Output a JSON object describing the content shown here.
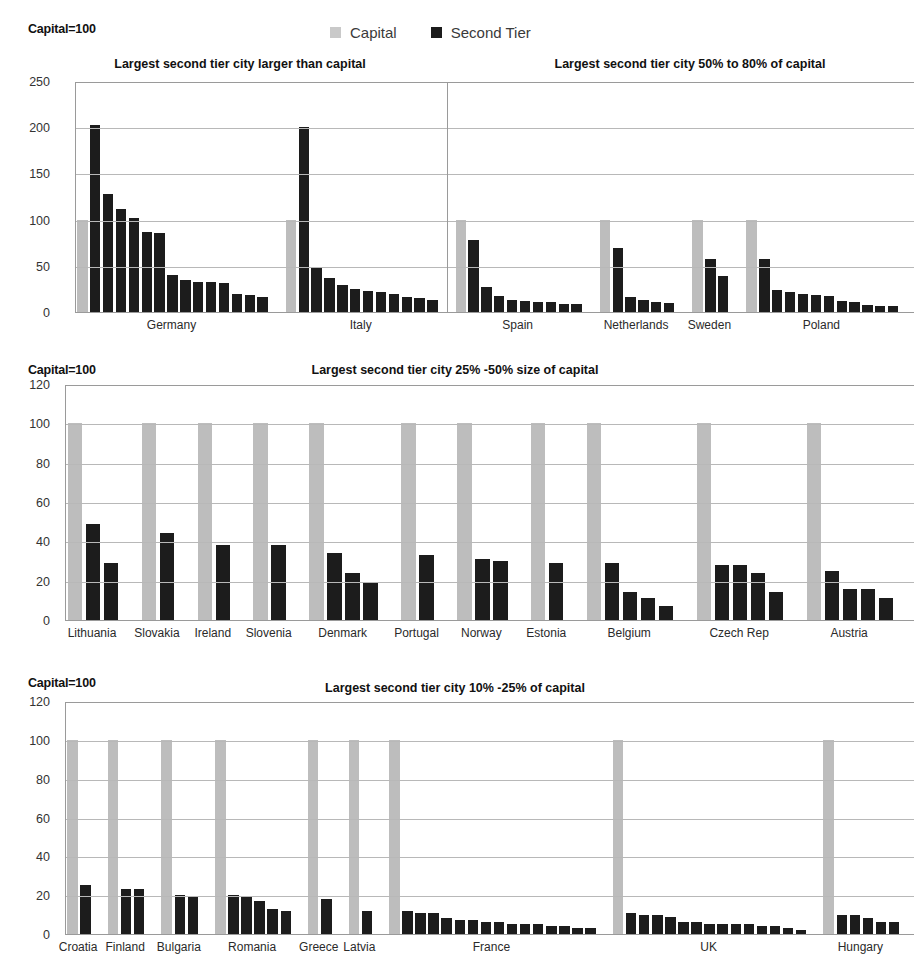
{
  "legend": {
    "items": [
      {
        "label": "Capital",
        "color": "#bdbdbd",
        "swatch_name": "capital-swatch"
      },
      {
        "label": "Second Tier",
        "color": "#1c1c1c",
        "swatch_name": "second-tier-swatch"
      }
    ]
  },
  "panels": [
    {
      "id": "panel-1",
      "capital_note": "Capital=100",
      "titles": [
        "Largest second tier city larger than capital",
        "Largest second tier city 50% to 80% of capital"
      ],
      "y_ticks": [
        0,
        50,
        100,
        150,
        200,
        250
      ],
      "ylim": [
        0,
        250
      ]
    },
    {
      "id": "panel-2",
      "capital_note": "Capital=100",
      "titles": [
        "Largest second tier city 25% -50% size of capital"
      ],
      "y_ticks": [
        0,
        20,
        40,
        60,
        80,
        100,
        120
      ],
      "ylim": [
        0,
        120
      ]
    },
    {
      "id": "panel-3",
      "capital_note": "Capital=100",
      "titles": [
        "Largest second tier city 10% -25% of capital"
      ],
      "y_ticks": [
        0,
        20,
        40,
        60,
        80,
        100,
        120
      ],
      "ylim": [
        0,
        120
      ]
    }
  ],
  "chart_data": [
    {
      "type": "bar",
      "title": "Largest second tier city larger than capital / Largest second tier city 50% to 80% of capital",
      "subtitle": "Capital=100",
      "xlabel": "",
      "ylabel": "",
      "ylim": [
        0,
        250
      ],
      "yticks": [
        0,
        50,
        100,
        150,
        200,
        250
      ],
      "grid": true,
      "legend": [
        "Capital",
        "Second Tier"
      ],
      "legend_position": "top-center",
      "note": "Each country group shows one grey Capital bar (=100) followed by black Second Tier city bars, sorted descending.",
      "groups": [
        {
          "country": "Germany",
          "capital": 100,
          "second_tier": [
            202,
            128,
            111,
            102,
            87,
            85,
            40,
            35,
            33,
            32,
            31,
            20,
            18,
            16
          ]
        },
        {
          "country": "Italy",
          "capital": 100,
          "second_tier": [
            200,
            49,
            37,
            29,
            25,
            23,
            22,
            19,
            16,
            15,
            13
          ]
        },
        {
          "country": "Spain",
          "capital": 100,
          "second_tier": [
            78,
            27,
            17,
            13,
            12,
            11,
            11,
            9,
            9
          ]
        },
        {
          "country": "Netherlands",
          "capital": 100,
          "second_tier": [
            69,
            16,
            13,
            11,
            10
          ]
        },
        {
          "country": "Sweden",
          "capital": 100,
          "second_tier": [
            57,
            39
          ]
        },
        {
          "country": "Poland",
          "capital": 100,
          "second_tier": [
            57,
            24,
            22,
            19,
            18,
            17,
            12,
            11,
            8,
            7,
            6
          ]
        }
      ],
      "panel_divider_after": "Italy"
    },
    {
      "type": "bar",
      "title": "Largest second tier city 25% -50% size of capital",
      "subtitle": "Capital=100",
      "xlabel": "",
      "ylabel": "",
      "ylim": [
        0,
        120
      ],
      "yticks": [
        0,
        20,
        40,
        60,
        80,
        100,
        120
      ],
      "grid": true,
      "legend": [
        "Capital",
        "Second Tier"
      ],
      "groups": [
        {
          "country": "Lithuania",
          "capital": 100,
          "second_tier": [
            49,
            29
          ]
        },
        {
          "country": "Slovakia",
          "capital": 100,
          "second_tier": [
            44
          ]
        },
        {
          "country": "Ireland",
          "capital": 100,
          "second_tier": [
            38
          ]
        },
        {
          "country": "Slovenia",
          "capital": 100,
          "second_tier": [
            38
          ]
        },
        {
          "country": "Denmark",
          "capital": 100,
          "second_tier": [
            34,
            24,
            19
          ]
        },
        {
          "country": "Portugal",
          "capital": 100,
          "second_tier": [
            33
          ]
        },
        {
          "country": "Norway",
          "capital": 100,
          "second_tier": [
            31,
            30
          ]
        },
        {
          "country": "Estonia",
          "capital": 100,
          "second_tier": [
            29
          ]
        },
        {
          "country": "Belgium",
          "capital": 100,
          "second_tier": [
            29,
            14,
            11,
            7
          ]
        },
        {
          "country": "Czech Rep",
          "capital": 100,
          "second_tier": [
            28,
            28,
            24,
            14
          ]
        },
        {
          "country": "Austria",
          "capital": 100,
          "second_tier": [
            25,
            16,
            16,
            11
          ]
        }
      ]
    },
    {
      "type": "bar",
      "title": "Largest second tier city 10% -25% of capital",
      "subtitle": "Capital=100",
      "xlabel": "",
      "ylabel": "",
      "ylim": [
        0,
        120
      ],
      "yticks": [
        0,
        20,
        40,
        60,
        80,
        100,
        120
      ],
      "grid": true,
      "legend": [
        "Capital",
        "Second Tier"
      ],
      "groups": [
        {
          "country": "Croatia",
          "capital": 100,
          "second_tier": [
            25
          ]
        },
        {
          "country": "Finland",
          "capital": 100,
          "second_tier": [
            23,
            23
          ]
        },
        {
          "country": "Bulgaria",
          "capital": 100,
          "second_tier": [
            20,
            19
          ]
        },
        {
          "country": "Romania",
          "capital": 100,
          "second_tier": [
            20,
            19,
            17,
            13,
            12
          ]
        },
        {
          "country": "Greece",
          "capital": 100,
          "second_tier": [
            18
          ]
        },
        {
          "country": "Latvia",
          "capital": 100,
          "second_tier": [
            12
          ]
        },
        {
          "country": "France",
          "capital": 100,
          "second_tier": [
            12,
            11,
            11,
            8,
            7,
            7,
            6,
            6,
            5,
            5,
            5,
            4,
            4,
            3,
            3
          ]
        },
        {
          "country": "UK",
          "capital": 100,
          "second_tier": [
            11,
            10,
            10,
            9,
            6,
            6,
            5,
            5,
            5,
            5,
            4,
            4,
            3,
            2
          ]
        },
        {
          "country": "Hungary",
          "capital": 100,
          "second_tier": [
            10,
            10,
            8,
            6,
            6
          ]
        }
      ]
    }
  ]
}
